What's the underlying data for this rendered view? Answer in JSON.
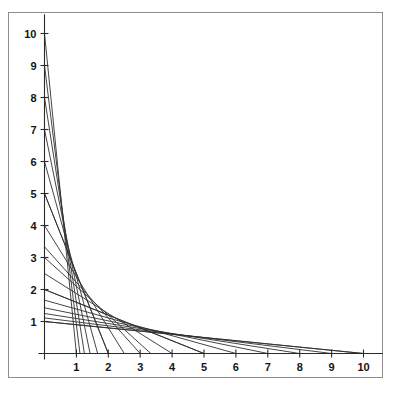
{
  "figure": {
    "title": "",
    "background_color": "#ffffff",
    "frame_color": "#8d8d8d",
    "axis_color": "#2a2a2a",
    "line_color": "#303030",
    "label_color": "#141414"
  },
  "axes": {
    "x_axis_label": "",
    "y_axis_label": "",
    "x_ticks": [
      "1",
      "2",
      "3",
      "4",
      "5",
      "6",
      "7",
      "8",
      "9",
      "10"
    ],
    "y_ticks": [
      "1",
      "2",
      "3",
      "4",
      "5",
      "6",
      "7",
      "8",
      "9",
      "10"
    ],
    "x_tick_values": [
      1,
      2,
      3,
      4,
      5,
      6,
      7,
      8,
      9,
      10
    ],
    "y_tick_values": [
      1,
      2,
      3,
      4,
      5,
      6,
      7,
      8,
      9,
      10
    ],
    "xlim": [
      0,
      10.6
    ],
    "ylim": [
      0,
      10.6
    ],
    "origin_label": ""
  },
  "chart_data": {
    "type": "line",
    "title": "",
    "xlabel": "",
    "ylabel": "",
    "xlim": [
      0,
      10.6
    ],
    "ylim": [
      0,
      10.6
    ],
    "grid": false,
    "legend": "none",
    "envelope": {
      "name": "hyperbola",
      "equation": "x*y = 10",
      "constant": 10
    },
    "x": [
      1,
      2,
      3,
      4,
      5,
      6,
      7,
      8,
      9,
      10
    ],
    "series": [
      {
        "name": "segment-k1",
        "k": 1,
        "y_intercept": 1,
        "x_intercept": 10,
        "points": [
          [
            0,
            1
          ],
          [
            10,
            0
          ]
        ]
      },
      {
        "name": "segment-k2",
        "k": 2,
        "y_intercept": 2,
        "x_intercept": 5,
        "points": [
          [
            0,
            2
          ],
          [
            5,
            0
          ]
        ]
      },
      {
        "name": "segment-k3",
        "k": 3,
        "y_intercept": 3,
        "x_intercept": 3.3333,
        "points": [
          [
            0,
            3
          ],
          [
            3.3333,
            0
          ]
        ]
      },
      {
        "name": "segment-k4",
        "k": 4,
        "y_intercept": 4,
        "x_intercept": 2.5,
        "points": [
          [
            0,
            4
          ],
          [
            2.5,
            0
          ]
        ]
      },
      {
        "name": "segment-k5",
        "k": 5,
        "y_intercept": 5,
        "x_intercept": 2,
        "points": [
          [
            0,
            5
          ],
          [
            2,
            0
          ]
        ]
      },
      {
        "name": "segment-k6",
        "k": 6,
        "y_intercept": 6,
        "x_intercept": 1.6667,
        "points": [
          [
            0,
            6
          ],
          [
            1.6667,
            0
          ]
        ]
      },
      {
        "name": "segment-k7",
        "k": 7,
        "y_intercept": 7,
        "x_intercept": 1.4286,
        "points": [
          [
            0,
            7
          ],
          [
            1.4286,
            0
          ]
        ]
      },
      {
        "name": "segment-k8",
        "k": 8,
        "y_intercept": 8,
        "x_intercept": 1.25,
        "points": [
          [
            0,
            8
          ],
          [
            1.25,
            0
          ]
        ]
      },
      {
        "name": "segment-k9",
        "k": 9,
        "y_intercept": 9,
        "x_intercept": 1.1111,
        "points": [
          [
            0,
            9
          ],
          [
            1.1111,
            0
          ]
        ]
      },
      {
        "name": "segment-k10",
        "k": 10,
        "y_intercept": 10,
        "x_intercept": 1,
        "points": [
          [
            0,
            10
          ],
          [
            1,
            0
          ]
        ]
      },
      {
        "name": "segment-x-axis-family",
        "k": 1,
        "y_intercept": 1,
        "x_intercept": 10,
        "points": [
          [
            0,
            1
          ],
          [
            10,
            0
          ]
        ]
      },
      {
        "name": "segment-diag-2-5",
        "k": 2,
        "y_intercept": 5,
        "x_intercept": 2,
        "points": [
          [
            0,
            5
          ],
          [
            2,
            0
          ]
        ]
      },
      {
        "name": "segment-diag-5-2",
        "k": 5,
        "y_intercept": 2,
        "x_intercept": 5,
        "points": [
          [
            0,
            2
          ],
          [
            5,
            0
          ]
        ]
      },
      {
        "name": "segment-diag-3-3",
        "k": 3,
        "y_intercept": 3.3333,
        "x_intercept": 3,
        "points": [
          [
            0,
            3.3333
          ],
          [
            3,
            0
          ]
        ]
      },
      {
        "name": "segment-diag-4-2",
        "k": 4,
        "y_intercept": 2.5,
        "x_intercept": 4,
        "points": [
          [
            0,
            2.5
          ],
          [
            4,
            0
          ]
        ]
      },
      {
        "name": "segment-diag-6-1",
        "k": 6,
        "y_intercept": 1.6667,
        "x_intercept": 6,
        "points": [
          [
            0,
            1.6667
          ],
          [
            6,
            0
          ]
        ]
      },
      {
        "name": "segment-diag-7-1",
        "k": 7,
        "y_intercept": 1.4286,
        "x_intercept": 7,
        "points": [
          [
            0,
            1.4286
          ],
          [
            7,
            0
          ]
        ]
      },
      {
        "name": "segment-diag-8-1",
        "k": 8,
        "y_intercept": 1.25,
        "x_intercept": 8,
        "points": [
          [
            0,
            1.25
          ],
          [
            8,
            0
          ]
        ]
      },
      {
        "name": "segment-diag-9-1",
        "k": 9,
        "y_intercept": 1.1111,
        "x_intercept": 9,
        "points": [
          [
            0,
            1.1111
          ],
          [
            9,
            0
          ]
        ]
      }
    ]
  }
}
